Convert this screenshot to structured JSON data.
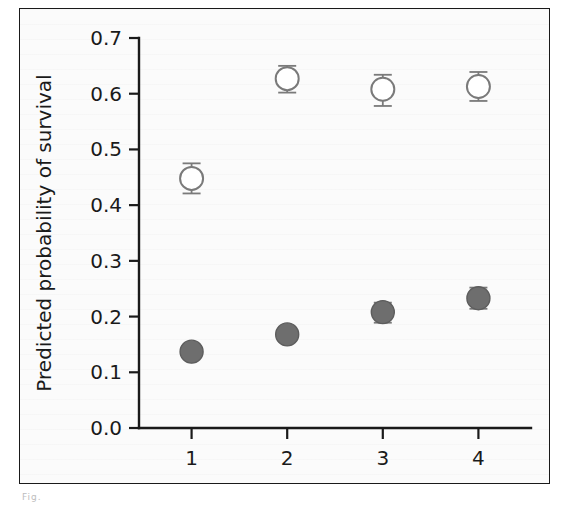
{
  "figure": {
    "caption_stub": "Fig.",
    "frame_color": "#1a1a1a",
    "background_color": "#fbfbfb"
  },
  "chart_data": {
    "type": "scatter",
    "title": "",
    "subtitle": "",
    "xlabel": "Heterozygosity quartile",
    "ylabel": "Predicted probability of survival",
    "categories": [
      "1",
      "2",
      "3",
      "4"
    ],
    "x": [
      1,
      2,
      3,
      4
    ],
    "xlim": [
      0.45,
      4.55
    ],
    "ylim": [
      0.0,
      0.7
    ],
    "ytick_labels": [
      "0.0",
      "0.1",
      "0.2",
      "0.3",
      "0.4",
      "0.5",
      "0.6",
      "0.7"
    ],
    "ytick_values": [
      0.0,
      0.1,
      0.2,
      0.3,
      0.4,
      0.5,
      0.6,
      0.7
    ],
    "xtick_labels": [
      "1",
      "2",
      "3",
      "4"
    ],
    "xtick_values": [
      1,
      2,
      3,
      4
    ],
    "grid": false,
    "legend": false,
    "legend_position": "none",
    "errorbars": true,
    "series": [
      {
        "name": "open-circle-series",
        "marker": "open-circle",
        "color": "#7a7a7a",
        "fill": "#ffffff",
        "values": [
          0.448,
          0.627,
          0.608,
          0.613
        ],
        "err_low": [
          0.027,
          0.025,
          0.03,
          0.026
        ],
        "err_high": [
          0.027,
          0.023,
          0.026,
          0.026
        ],
        "ci_low": [
          0.421,
          0.602,
          0.578,
          0.587
        ],
        "ci_high": [
          0.475,
          0.65,
          0.634,
          0.639
        ]
      },
      {
        "name": "filled-circle-series",
        "marker": "filled-circle",
        "color": "#6e6e6e",
        "fill": "#6e6e6e",
        "values": [
          0.137,
          0.168,
          0.208,
          0.233
        ],
        "err_low": [
          0.01,
          0.012,
          0.019,
          0.019
        ],
        "err_high": [
          0.01,
          0.012,
          0.017,
          0.019
        ],
        "ci_low": [
          0.127,
          0.156,
          0.189,
          0.214
        ],
        "ci_high": [
          0.147,
          0.18,
          0.225,
          0.252
        ]
      }
    ]
  }
}
